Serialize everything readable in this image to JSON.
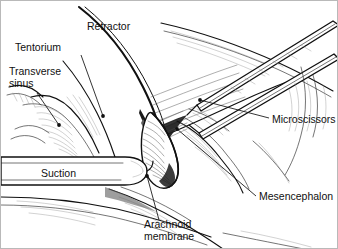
{
  "figure": {
    "style": "pen-and-ink line drawing",
    "background_color": "#ffffff",
    "ink_color": "#101010",
    "border_color": "#b9b9b9",
    "width": 338,
    "height": 249
  },
  "labels": [
    {
      "id": "retractor",
      "text": "Retractor",
      "x": 86,
      "y": 29,
      "anchor": "start",
      "lines": [
        "Retractor"
      ],
      "leader": null
    },
    {
      "id": "tentorium",
      "text": "Tentorium",
      "x": 14,
      "y": 50,
      "anchor": "start",
      "lines": [
        "Tentorium"
      ],
      "leader": {
        "path": "M 80 54 L 102 115",
        "dot": {
          "x": 102,
          "y": 115
        }
      }
    },
    {
      "id": "transverse-sinus",
      "text": "Transverse sinus",
      "x": 8,
      "y": 74,
      "anchor": "start",
      "lines": [
        "Transverse",
        "sinus"
      ],
      "leader": {
        "path": "M 36 92 L 58 124",
        "dot": {
          "x": 58,
          "y": 124
        }
      }
    },
    {
      "id": "suction",
      "text": "Suction",
      "x": 40,
      "y": 176,
      "anchor": "start",
      "lines": [
        "Suction"
      ],
      "leader": null
    },
    {
      "id": "arachnoid-membrane",
      "text": "Arachnoid membrane",
      "x": 143,
      "y": 227,
      "anchor": "start",
      "lines": [
        "Arachnoid",
        "membrane"
      ],
      "leader": {
        "path": "M 158 219 L 146 175",
        "dot": {
          "x": 146,
          "y": 175
        }
      }
    },
    {
      "id": "microscissors",
      "text": "Microscissors",
      "x": 271,
      "y": 122,
      "anchor": "start",
      "lines": [
        "Microscissors"
      ],
      "leader": {
        "path": "M 268 117 L 199 99",
        "dot": {
          "x": 199,
          "y": 99
        }
      }
    },
    {
      "id": "mesencephalon",
      "text": "Mesencephalon",
      "x": 258,
      "y": 199,
      "anchor": "start",
      "lines": [
        "Mesencephalon"
      ],
      "leader": {
        "path": "M 255 195 L 176 128",
        "dot": {
          "x": 176,
          "y": 128
        }
      }
    }
  ],
  "structures": [
    {
      "id": "retractor-blade",
      "name": "Retractor",
      "kind": "instrument"
    },
    {
      "id": "suction-tube",
      "name": "Suction",
      "kind": "instrument"
    },
    {
      "id": "microscissors-blades",
      "name": "Microscissors",
      "kind": "instrument"
    },
    {
      "id": "tentorium",
      "name": "Tentorium",
      "kind": "anatomy"
    },
    {
      "id": "transverse-sinus",
      "name": "Transverse sinus",
      "kind": "anatomy"
    },
    {
      "id": "arachnoid-membrane",
      "name": "Arachnoid membrane",
      "kind": "anatomy"
    },
    {
      "id": "mesencephalon",
      "name": "Mesencephalon",
      "kind": "anatomy"
    }
  ]
}
